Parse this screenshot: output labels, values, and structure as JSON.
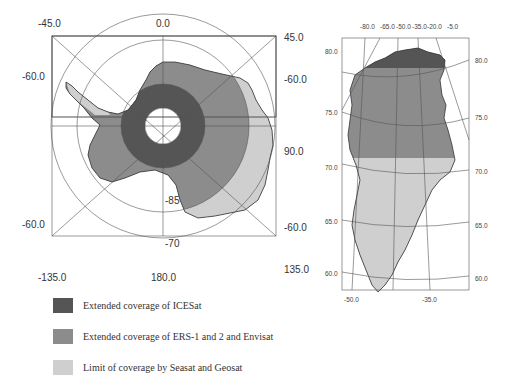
{
  "colors": {
    "icesat": "#555555",
    "ers": "#8c8c8c",
    "seasat": "#cfcfcf",
    "background": "#ffffff",
    "grid": "#444444"
  },
  "antarctica_map": {
    "top_labels": [
      "-45.0",
      "0.0",
      "45.0"
    ],
    "left_labels": [
      "-60.0",
      "-60.0"
    ],
    "right_labels": [
      "-60.0",
      "90.0",
      "-60.0"
    ],
    "bottom_labels": [
      "-135.0",
      "180.0",
      "135.0"
    ],
    "inner_labels": [
      "-85",
      "-70"
    ]
  },
  "greenland_map": {
    "top_labels": [
      "-80.0",
      "-65.0",
      "-50.0",
      "-35.0",
      "-20.0",
      "-5.0"
    ],
    "left_labels": [
      "80.0",
      "75.0",
      "70.0",
      "65.0",
      "60.0"
    ],
    "right_labels": [
      "80.0",
      "75.0",
      "70.0",
      "65.0",
      "60.0"
    ],
    "bottom_labels": [
      "-50.0",
      "-35.0"
    ]
  },
  "legend": {
    "items": [
      {
        "label": "Extended coverage of ICESat",
        "color": "#555555"
      },
      {
        "label": "Extended coverage of ERS-1 and 2 and Envisat",
        "color": "#8c8c8c"
      },
      {
        "label": "Limit of coverage by Seasat and Geosat",
        "color": "#cfcfcf"
      }
    ]
  }
}
